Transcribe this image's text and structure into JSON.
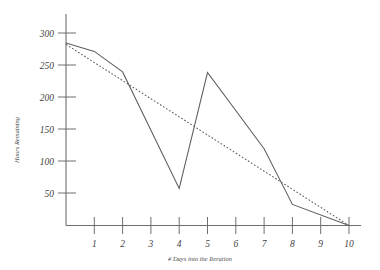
{
  "chart_data": {
    "type": "line",
    "title": "",
    "xlabel": "# Days into the Iteration",
    "ylabel": "Hours Remaining",
    "xlim": [
      0,
      10
    ],
    "ylim": [
      0,
      320
    ],
    "grid": false,
    "legend": "none",
    "x_tick_labels": [
      "1",
      "2",
      "3",
      "4",
      "5",
      "6",
      "7",
      "8",
      "9",
      "10"
    ],
    "x_ticks": [
      1,
      2,
      3,
      4,
      5,
      6,
      7,
      8,
      9,
      10
    ],
    "y_tick_labels": [
      "300",
      "250",
      "200",
      "150",
      "100",
      "50"
    ],
    "y_ticks": [
      300,
      250,
      200,
      150,
      100,
      50
    ],
    "series": [
      {
        "name": "Actual Hours Remaining",
        "style": "solid",
        "color": "#5d5d5d",
        "x": [
          0,
          1,
          2,
          4,
          5,
          7,
          8,
          10
        ],
        "values": [
          285,
          272,
          240,
          58,
          239,
          120,
          33,
          0
        ]
      },
      {
        "name": "Ideal Burndown",
        "style": "dotted",
        "color": "#5d5d5d",
        "x": [
          0,
          10
        ],
        "values": [
          283,
          0
        ]
      }
    ]
  },
  "axes": {
    "y_title": "Hours Remaining",
    "x_title": "# Days into the Iteration"
  }
}
